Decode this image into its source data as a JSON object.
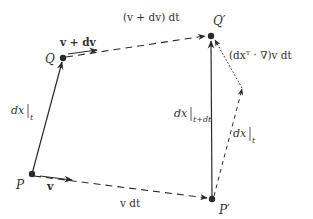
{
  "diagram": {
    "type": "vector-kinematics",
    "points": {
      "P": {
        "label": "P"
      },
      "Q": {
        "label": "Q"
      },
      "P_prime": {
        "label": "P′"
      },
      "Q_prime": {
        "label": "Q′"
      }
    },
    "edges": [
      {
        "id": "dx_t",
        "from": "P",
        "to": "Q",
        "style": "solid",
        "label_main": "dx",
        "label_sub": "t"
      },
      {
        "id": "v_dt",
        "from": "P",
        "to": "P_prime",
        "style": "dashed",
        "label": "v dt"
      },
      {
        "id": "v_plus_dv_dt",
        "from": "Q",
        "to": "Q_prime",
        "style": "dashed",
        "label": "(v + dv) dt"
      },
      {
        "id": "dx_t_plus_dt",
        "from": "P_prime",
        "to": "Q_prime",
        "style": "solid",
        "label_main": "dx",
        "label_sub": "t+dt"
      },
      {
        "id": "dx_t_translated",
        "from": "P_prime",
        "to": "mid",
        "style": "dashed",
        "label_main": "dx",
        "label_sub": "t"
      },
      {
        "id": "gradient_term",
        "from": "mid",
        "to": "Q_prime",
        "style": "dotted",
        "label": "(dxᵀ · ∇)v dt"
      }
    ],
    "velocity_arrows": [
      {
        "at": "P",
        "label": "v"
      },
      {
        "at": "Q",
        "label": "v + dv"
      }
    ],
    "colors": {
      "ink": "#2a2a2a",
      "label": "#333333"
    }
  }
}
